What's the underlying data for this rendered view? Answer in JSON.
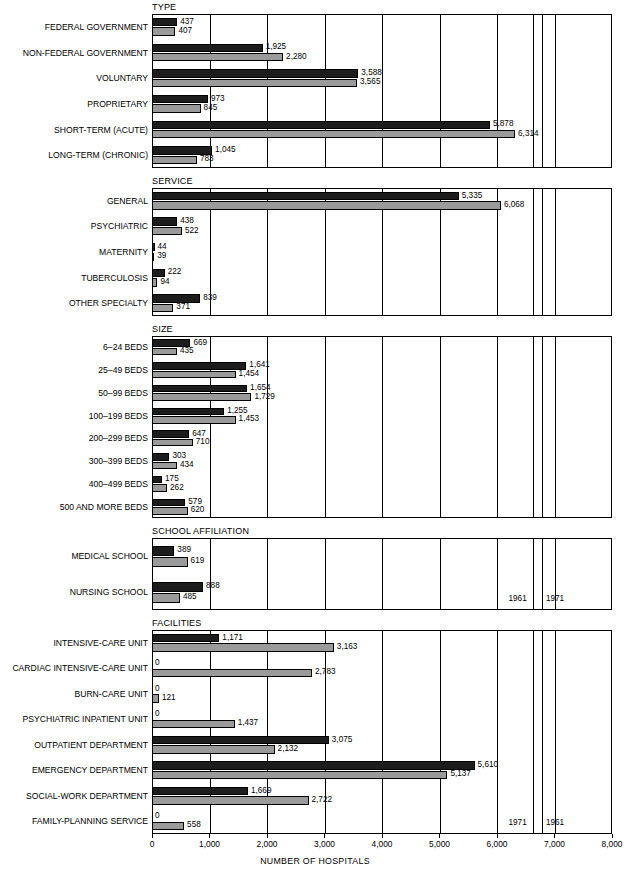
{
  "axis": {
    "title": "NUMBER OF HOSPITALS",
    "min": 0,
    "max": 8000,
    "ticks": [
      0,
      1000,
      2000,
      3000,
      4000,
      5000,
      6000,
      7000,
      8000
    ],
    "tick_labels": [
      "0",
      "1,000",
      "2,000",
      "3,000",
      "4,000",
      "5,000",
      "6,000",
      "7,000",
      "8,000"
    ]
  },
  "legend": {
    "series_a": "1961",
    "series_b": "1971",
    "school_affiliation_order": [
      "1961",
      "1971"
    ],
    "facilities_order": [
      "1971",
      "1961"
    ],
    "color_dark": "#1c1c1c",
    "color_light": "#9a9a9a"
  },
  "chart_data": {
    "type": "bar",
    "orientation": "horizontal",
    "title": "",
    "xlabel": "NUMBER OF HOSPITALS",
    "ylabel": "",
    "xlim": [
      0,
      8000
    ],
    "grid": true,
    "legend_position": "inline-right",
    "series": [
      {
        "name": "1961",
        "color": "#1c1c1c"
      },
      {
        "name": "1971",
        "color": "#9a9a9a"
      }
    ],
    "panels": [
      {
        "title": "TYPE",
        "categories": [
          "FEDERAL GOVERNMENT",
          "NON-FEDERAL GOVERNMENT",
          "VOLUNTARY",
          "PROPRIETARY",
          "SHORT-TERM (ACUTE)",
          "LONG-TERM (CHRONIC)"
        ],
        "values_1961": [
          437,
          1925,
          3588,
          973,
          5878,
          1045
        ],
        "values_1971": [
          407,
          2280,
          3565,
          845,
          6314,
          783
        ],
        "labels_1961": [
          "437",
          "1,925",
          "3,588",
          "973",
          "5,878",
          "1,045"
        ],
        "labels_1971": [
          "407",
          "2,280",
          "3,565",
          "845",
          "6,314",
          "783"
        ]
      },
      {
        "title": "SERVICE",
        "categories": [
          "GENERAL",
          "PSYCHIATRIC",
          "MATERNITY",
          "TUBERCULOSIS",
          "OTHER SPECIALTY"
        ],
        "values_1961": [
          5335,
          438,
          44,
          222,
          839
        ],
        "values_1971": [
          6068,
          522,
          39,
          94,
          371
        ],
        "labels_1961": [
          "5,335",
          "438",
          "44",
          "222",
          "839"
        ],
        "labels_1971": [
          "6,068",
          "522",
          "39",
          "94",
          "371"
        ]
      },
      {
        "title": "SIZE",
        "categories": [
          "6–24 BEDS",
          "25–49 BEDS",
          "50–99 BEDS",
          "100–199 BEDS",
          "200–299 BEDS",
          "300–399 BEDS",
          "400–499 BEDS",
          "500 AND MORE BEDS"
        ],
        "values_1961": [
          669,
          1641,
          1654,
          1255,
          647,
          303,
          175,
          579
        ],
        "values_1971": [
          435,
          1454,
          1729,
          1453,
          710,
          434,
          262,
          620
        ],
        "labels_1961": [
          "669",
          "1,641",
          "1,654",
          "1,255",
          "647",
          "303",
          "175",
          "579"
        ],
        "labels_1971": [
          "435",
          "1,454",
          "1,729",
          "1,453",
          "710",
          "434",
          "262",
          "620"
        ]
      },
      {
        "title": "SCHOOL AFFILIATION",
        "categories": [
          "MEDICAL SCHOOL",
          "NURSING SCHOOL"
        ],
        "values_1961": [
          389,
          888
        ],
        "values_1971": [
          619,
          485
        ],
        "labels_1961": [
          "389",
          "888"
        ],
        "labels_1971": [
          "619",
          "485"
        ]
      },
      {
        "title": "FACILITIES",
        "categories": [
          "INTENSIVE-CARE UNIT",
          "CARDIAC INTENSIVE-CARE UNIT",
          "BURN-CARE UNIT",
          "PSYCHIATRIC INPATIENT UNIT",
          "OUTPATIENT DEPARTMENT",
          "EMERGENCY DEPARTMENT",
          "SOCIAL-WORK DEPARTMENT",
          "FAMILY-PLANNING SERVICE"
        ],
        "values_1961": [
          1171,
          0,
          0,
          0,
          3075,
          5610,
          1669,
          0
        ],
        "values_1971": [
          3163,
          2783,
          121,
          1437,
          2132,
          5137,
          2722,
          558
        ],
        "labels_1961": [
          "1,171",
          "0",
          "0",
          "0",
          "3,075",
          "5,610",
          "1,669",
          "0"
        ],
        "labels_1971": [
          "3,163",
          "2,783",
          "121",
          "1,437",
          "2,132",
          "5,137",
          "2,722",
          "558"
        ]
      }
    ]
  }
}
